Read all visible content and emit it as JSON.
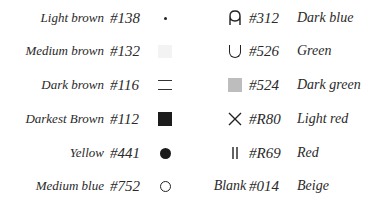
{
  "legend": {
    "left": [
      {
        "name": "Light brown",
        "code": "#138",
        "symbol": "small-dot"
      },
      {
        "name": "Medium brown",
        "code": "#132",
        "symbol": "very-light-square"
      },
      {
        "name": "Dark brown",
        "code": "#116",
        "symbol": "double-line"
      },
      {
        "name": "Darkest Brown",
        "code": "#112",
        "symbol": "filled-black-square"
      },
      {
        "name": "Yellow",
        "code": "#441",
        "symbol": "filled-circle"
      },
      {
        "name": "Medium blue",
        "code": "#752",
        "symbol": "open-circle"
      }
    ],
    "right": [
      {
        "name": "Dark blue",
        "code": "#312",
        "symbol": "s-u-glyph"
      },
      {
        "name": "Green",
        "code": "#526",
        "symbol": "u-glyph"
      },
      {
        "name": "Dark green",
        "code": "#524",
        "symbol": "grey-square"
      },
      {
        "name": "Light red",
        "code": "#R80",
        "symbol": "x-cross"
      },
      {
        "name": "Red",
        "code": "#R69",
        "symbol": "double-vertical-bar"
      },
      {
        "name": "Beige",
        "code": "#014",
        "symbol": "blank",
        "symbol_label": "Blank"
      }
    ]
  }
}
